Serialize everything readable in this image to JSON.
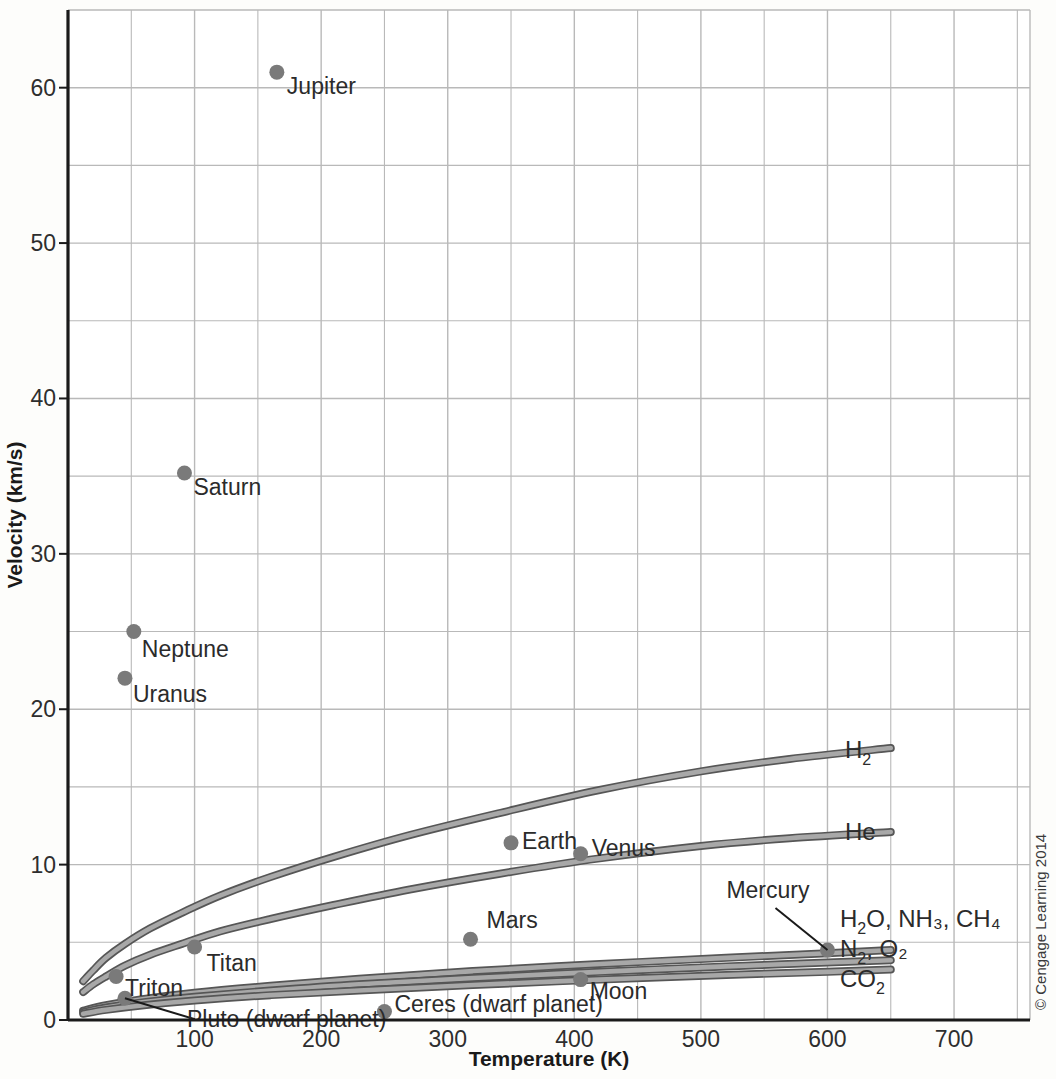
{
  "figure": {
    "credit": "© Cengage Learning 2014",
    "background_color": "#fdfdfb",
    "curve_color": "#6f6f6f",
    "point_color": "#7a7a7a",
    "grid_color": "#b9b9b9",
    "axis_color": "#1a1a1a"
  },
  "chart_data": {
    "type": "scatter",
    "title": "",
    "xlabel": "Temperature (K)",
    "ylabel": "Velocity (km/s)",
    "xlim": [
      0,
      760
    ],
    "ylim": [
      0,
      65
    ],
    "xticks": [
      100,
      200,
      300,
      400,
      500,
      600,
      700
    ],
    "xtick_labels": [
      "100",
      "200",
      "300",
      "400",
      "500",
      "600",
      "700"
    ],
    "yticks": [
      0,
      10,
      20,
      30,
      40,
      50,
      60
    ],
    "ytick_labels": [
      "0",
      "10",
      "20",
      "30",
      "40",
      "50",
      "60"
    ],
    "y_minor_ticks": [
      5,
      15,
      25,
      35,
      45,
      55
    ],
    "x_minor_ticks": [
      50,
      150,
      250,
      350,
      450,
      550,
      650,
      750
    ],
    "grid": true,
    "legend_position": "inline-right-labels",
    "points": [
      {
        "name": "Jupiter",
        "x": 165,
        "y": 61.0,
        "label_dx": 10,
        "label_dy": 22,
        "anchor": "start"
      },
      {
        "name": "Saturn",
        "x": 92,
        "y": 35.2,
        "label_dx": 9,
        "label_dy": 22,
        "anchor": "start"
      },
      {
        "name": "Neptune",
        "x": 52,
        "y": 25.0,
        "label_dx": 8,
        "label_dy": 25,
        "anchor": "start"
      },
      {
        "name": "Uranus",
        "x": 45,
        "y": 22.0,
        "label_dx": 8,
        "label_dy": 24,
        "anchor": "start"
      },
      {
        "name": "Earth",
        "x": 350,
        "y": 11.4,
        "label_dx": 11,
        "label_dy": 6,
        "anchor": "start"
      },
      {
        "name": "Venus",
        "x": 405,
        "y": 10.7,
        "label_dx": 11,
        "label_dy": 2,
        "anchor": "start"
      },
      {
        "name": "Mars",
        "x": 318,
        "y": 5.2,
        "label_dx": 16,
        "label_dy": -11,
        "anchor": "start"
      },
      {
        "name": "Mercury",
        "x": 600,
        "y": 4.5,
        "label_dx": -18,
        "label_dy": -52,
        "anchor": "end",
        "leader": true
      },
      {
        "name": "Titan",
        "x": 100,
        "y": 4.7,
        "label_dx": 12,
        "label_dy": 24,
        "anchor": "start"
      },
      {
        "name": "Moon",
        "x": 405,
        "y": 2.6,
        "label_dx": 9,
        "label_dy": 19,
        "anchor": "start"
      },
      {
        "name": "Triton",
        "x": 38,
        "y": 2.8,
        "label_dx": 9,
        "label_dy": 20,
        "anchor": "start"
      },
      {
        "name": "Ceres (dwarf planet)",
        "x": 250,
        "y": 0.55,
        "label_dx": 10,
        "label_dy": 1,
        "anchor": "start"
      },
      {
        "name": "Pluto (dwarf planet)",
        "x": 45,
        "y": 1.4,
        "label_dx": 62,
        "label_dy": 29,
        "anchor": "start",
        "leader": true
      }
    ],
    "series": [
      {
        "name": "H2",
        "label": "H₂",
        "label_parts": {
          "base": "H",
          "sub": "2"
        },
        "x": [
          12,
          20,
          30,
          45,
          65,
          90,
          120,
          160,
          210,
          270,
          340,
          420,
          500,
          570,
          650
        ],
        "y": [
          2.5,
          3.2,
          4.0,
          4.9,
          5.9,
          6.9,
          8.0,
          9.2,
          10.5,
          11.9,
          13.3,
          14.8,
          16.0,
          16.8,
          17.5
        ]
      },
      {
        "name": "He",
        "label": "He",
        "label_parts": {
          "base": "He",
          "sub": ""
        },
        "x": [
          12,
          20,
          30,
          45,
          65,
          90,
          120,
          160,
          210,
          270,
          340,
          420,
          500,
          570,
          650
        ],
        "y": [
          1.8,
          2.3,
          2.8,
          3.5,
          4.2,
          4.9,
          5.7,
          6.5,
          7.4,
          8.4,
          9.4,
          10.4,
          11.2,
          11.7,
          12.1
        ]
      },
      {
        "name": "H2O, NH3, CH4",
        "label": "H₂O, NH₃, CH₄",
        "label_parts": {
          "base": "H",
          "sub": "2"
        },
        "x": [
          12,
          30,
          60,
          100,
          160,
          230,
          320,
          420,
          520,
          600,
          650
        ],
        "y": [
          0.6,
          0.95,
          1.35,
          1.75,
          2.2,
          2.65,
          3.15,
          3.6,
          4.0,
          4.3,
          4.5
        ]
      },
      {
        "name": "N2, O2",
        "label": "N₂, O₂",
        "label_parts": {
          "base": "N",
          "sub": "2"
        },
        "x": [
          12,
          30,
          60,
          100,
          160,
          230,
          320,
          420,
          520,
          600,
          650
        ],
        "y": [
          0.5,
          0.8,
          1.15,
          1.5,
          1.9,
          2.3,
          2.7,
          3.1,
          3.45,
          3.7,
          3.85
        ]
      },
      {
        "name": "CO2",
        "label": "CO₂",
        "label_parts": {
          "base": "CO",
          "sub": "2"
        },
        "x": [
          12,
          30,
          60,
          100,
          160,
          230,
          320,
          420,
          520,
          600,
          650
        ],
        "y": [
          0.4,
          0.65,
          0.95,
          1.25,
          1.6,
          1.9,
          2.25,
          2.6,
          2.9,
          3.1,
          3.25
        ]
      }
    ],
    "curve_labels": [
      {
        "key": "H2",
        "base": "H",
        "sub": "2",
        "rest": "",
        "x": 845,
        "y": 758
      },
      {
        "key": "He",
        "base": "He",
        "sub": "",
        "rest": "",
        "x": 845,
        "y": 840
      },
      {
        "key": "H2O, NH3, CH4",
        "base": "H",
        "sub": "2",
        "rest": "O, NH₃, CH₄",
        "x": 840,
        "y": 927
      },
      {
        "key": "N2, O2",
        "base": "N",
        "sub": "2",
        "rest": ", O₂",
        "x": 840,
        "y": 957
      },
      {
        "key": "CO2",
        "base": "CO",
        "sub": "2",
        "rest": "",
        "x": 840,
        "y": 987
      }
    ]
  }
}
